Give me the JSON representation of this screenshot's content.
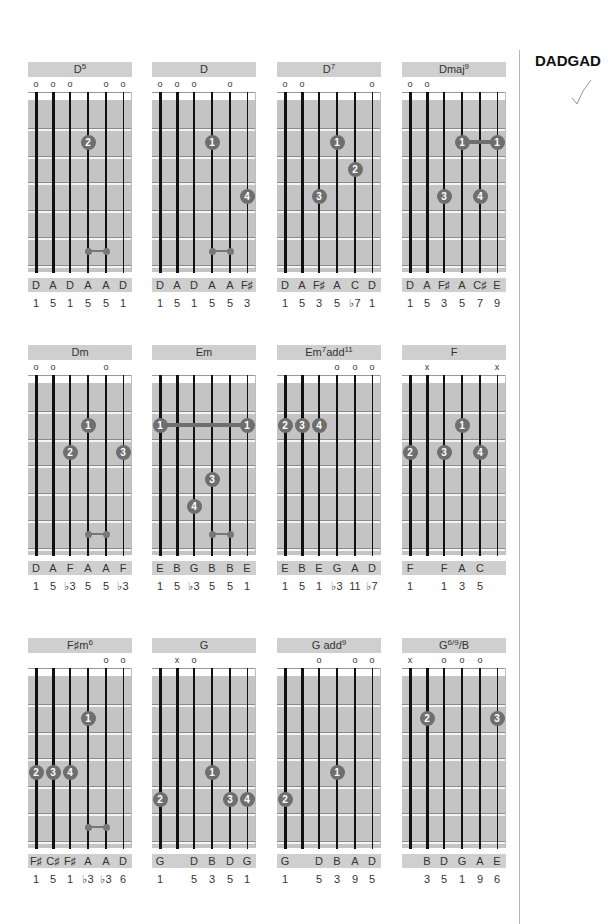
{
  "tuning": {
    "name": "DADGAD",
    "check_icon": "checkmark-icon"
  },
  "layout": {
    "columns": [
      28,
      152,
      277,
      402
    ],
    "rows": [
      62,
      345,
      638
    ],
    "string_offsets": [
      8,
      25,
      42,
      60,
      78,
      95
    ],
    "fret_lines": [
      66,
      94,
      120,
      148,
      175,
      203
    ],
    "slot_centers": [
      52,
      80,
      107,
      134,
      161,
      189
    ]
  },
  "colors": {
    "bar": "#cfcfcf",
    "board": "#c4c4c4",
    "finger": "#6e6e6e"
  },
  "chords": [
    {
      "name": "D",
      "sup": "5",
      "suffix": "",
      "col": 0,
      "row": 0,
      "markers": [
        "o",
        "o",
        "o",
        "",
        "o",
        "o"
      ],
      "fingers": [
        {
          "s": 3,
          "slot": 2,
          "label": "2"
        }
      ],
      "barres": [],
      "minis": [
        {
          "from": 3,
          "to": 4,
          "slot": 6
        }
      ],
      "notes": [
        "D",
        "A",
        "D",
        "A",
        "A",
        "D"
      ],
      "intervals": [
        "1",
        "5",
        "1",
        "5",
        "5",
        "1"
      ]
    },
    {
      "name": "D",
      "sup": "",
      "suffix": "",
      "col": 1,
      "row": 0,
      "markers": [
        "o",
        "o",
        "o",
        "",
        "o",
        ""
      ],
      "fingers": [
        {
          "s": 3,
          "slot": 2,
          "label": "1"
        },
        {
          "s": 5,
          "slot": 4,
          "label": "4"
        }
      ],
      "barres": [],
      "minis": [
        {
          "from": 3,
          "to": 4,
          "slot": 6
        }
      ],
      "notes": [
        "D",
        "A",
        "D",
        "A",
        "A",
        "F♯"
      ],
      "intervals": [
        "1",
        "5",
        "1",
        "5",
        "5",
        "3"
      ]
    },
    {
      "name": "D",
      "sup": "7",
      "suffix": "",
      "col": 2,
      "row": 0,
      "markers": [
        "o",
        "o",
        "",
        "",
        "",
        "o"
      ],
      "fingers": [
        {
          "s": 3,
          "slot": 2,
          "label": "1"
        },
        {
          "s": 4,
          "slot": 3,
          "label": "2"
        },
        {
          "s": 2,
          "slot": 4,
          "label": "3"
        }
      ],
      "barres": [],
      "minis": [],
      "notes": [
        "D",
        "A",
        "F♯",
        "A",
        "C",
        "D"
      ],
      "intervals": [
        "1",
        "5",
        "3",
        "5",
        "♭7",
        "1"
      ]
    },
    {
      "name": "Dmaj",
      "sup": "9",
      "suffix": "",
      "col": 3,
      "row": 0,
      "markers": [
        "o",
        "o",
        "",
        "",
        "",
        ""
      ],
      "fingers": [
        {
          "s": 3,
          "slot": 2,
          "label": "1"
        },
        {
          "s": 5,
          "slot": 2,
          "label": "1"
        },
        {
          "s": 2,
          "slot": 4,
          "label": "3"
        },
        {
          "s": 4,
          "slot": 4,
          "label": "4"
        }
      ],
      "barres": [
        {
          "from": 3,
          "to": 5,
          "slot": 2
        }
      ],
      "minis": [],
      "notes": [
        "D",
        "A",
        "F♯",
        "A",
        "C♯",
        "E"
      ],
      "intervals": [
        "1",
        "5",
        "3",
        "5",
        "7",
        "9"
      ]
    },
    {
      "name": "Dm",
      "sup": "",
      "suffix": "",
      "col": 0,
      "row": 1,
      "markers": [
        "o",
        "o",
        "",
        "",
        "o",
        ""
      ],
      "fingers": [
        {
          "s": 3,
          "slot": 2,
          "label": "1"
        },
        {
          "s": 2,
          "slot": 3,
          "label": "2"
        },
        {
          "s": 5,
          "slot": 3,
          "label": "3"
        }
      ],
      "barres": [],
      "minis": [
        {
          "from": 3,
          "to": 4,
          "slot": 6
        }
      ],
      "notes": [
        "D",
        "A",
        "F",
        "A",
        "A",
        "F"
      ],
      "intervals": [
        "1",
        "5",
        "♭3",
        "5",
        "5",
        "♭3"
      ]
    },
    {
      "name": "Em",
      "sup": "",
      "suffix": "",
      "col": 1,
      "row": 1,
      "markers": [
        "",
        "",
        "",
        "",
        "",
        ""
      ],
      "fingers": [
        {
          "s": 0,
          "slot": 2,
          "label": "1"
        },
        {
          "s": 5,
          "slot": 2,
          "label": "1"
        },
        {
          "s": 3,
          "slot": 4,
          "label": "3"
        },
        {
          "s": 2,
          "slot": 5,
          "label": "4"
        }
      ],
      "barres": [
        {
          "from": 0,
          "to": 5,
          "slot": 2
        }
      ],
      "minis": [
        {
          "from": 3,
          "to": 4,
          "slot": 6
        }
      ],
      "notes": [
        "E",
        "B",
        "G",
        "B",
        "B",
        "E"
      ],
      "intervals": [
        "1",
        "5",
        "♭3",
        "5",
        "5",
        "1"
      ]
    },
    {
      "name": "Em",
      "sup": "7",
      "suffix": "add",
      "sup2": "11",
      "col": 2,
      "row": 1,
      "markers": [
        "",
        "",
        "",
        "o",
        "o",
        "o"
      ],
      "fingers": [
        {
          "s": 0,
          "slot": 2,
          "label": "2"
        },
        {
          "s": 1,
          "slot": 2,
          "label": "3"
        },
        {
          "s": 2,
          "slot": 2,
          "label": "4"
        }
      ],
      "barres": [],
      "minis": [],
      "notes": [
        "E",
        "B",
        "E",
        "G",
        "A",
        "D"
      ],
      "intervals": [
        "1",
        "5",
        "1",
        "♭3",
        "11",
        "♭7"
      ]
    },
    {
      "name": "F",
      "sup": "",
      "suffix": "",
      "col": 3,
      "row": 1,
      "markers": [
        "",
        "x",
        "",
        "",
        "",
        "x"
      ],
      "fingers": [
        {
          "s": 3,
          "slot": 2,
          "label": "1"
        },
        {
          "s": 0,
          "slot": 3,
          "label": "2"
        },
        {
          "s": 2,
          "slot": 3,
          "label": "3"
        },
        {
          "s": 4,
          "slot": 3,
          "label": "4"
        }
      ],
      "barres": [],
      "minis": [],
      "notes": [
        "F",
        "",
        "F",
        "A",
        "C",
        ""
      ],
      "intervals": [
        "1",
        "",
        "1",
        "3",
        "5",
        ""
      ]
    },
    {
      "name": "F♯m",
      "sup": "6",
      "suffix": "",
      "col": 0,
      "row": 2,
      "markers": [
        "",
        "",
        "",
        "",
        "o",
        "o"
      ],
      "fingers": [
        {
          "s": 3,
          "slot": 2,
          "label": "1"
        },
        {
          "s": 0,
          "slot": 4,
          "label": "2"
        },
        {
          "s": 1,
          "slot": 4,
          "label": "3"
        },
        {
          "s": 2,
          "slot": 4,
          "label": "4"
        }
      ],
      "barres": [],
      "minis": [
        {
          "from": 3,
          "to": 4,
          "slot": 6
        }
      ],
      "notes": [
        "F♯",
        "C♯",
        "F♯",
        "A",
        "A",
        "D"
      ],
      "intervals": [
        "1",
        "5",
        "1",
        "♭3",
        "♭3",
        "6"
      ]
    },
    {
      "name": "G",
      "sup": "",
      "suffix": "",
      "col": 1,
      "row": 2,
      "markers": [
        "",
        "x",
        "o",
        "",
        "",
        ""
      ],
      "fingers": [
        {
          "s": 3,
          "slot": 4,
          "label": "1"
        },
        {
          "s": 0,
          "slot": 5,
          "label": "2"
        },
        {
          "s": 4,
          "slot": 5,
          "label": "3"
        },
        {
          "s": 5,
          "slot": 5,
          "label": "4"
        }
      ],
      "barres": [],
      "minis": [],
      "notes": [
        "G",
        "",
        "D",
        "B",
        "D",
        "G"
      ],
      "intervals": [
        "1",
        "",
        "5",
        "3",
        "5",
        "1"
      ]
    },
    {
      "name": "G add",
      "sup": "9",
      "suffix": "",
      "col": 2,
      "row": 2,
      "markers": [
        "",
        "",
        "o",
        "",
        "o",
        "o"
      ],
      "fingers": [
        {
          "s": 3,
          "slot": 4,
          "label": "1"
        },
        {
          "s": 0,
          "slot": 5,
          "label": "2"
        }
      ],
      "barres": [],
      "minis": [],
      "notes": [
        "G",
        "",
        "D",
        "B",
        "A",
        "D"
      ],
      "intervals": [
        "1",
        "",
        "5",
        "3",
        "9",
        "5"
      ]
    },
    {
      "name": "G",
      "sup": "6/9",
      "suffix": "/B",
      "col": 3,
      "row": 2,
      "markers": [
        "x",
        "",
        "o",
        "o",
        "o",
        ""
      ],
      "fingers": [
        {
          "s": 1,
          "slot": 2,
          "label": "2"
        },
        {
          "s": 5,
          "slot": 2,
          "label": "3"
        }
      ],
      "barres": [],
      "minis": [],
      "notes": [
        "",
        "B",
        "D",
        "G",
        "A",
        "E"
      ],
      "intervals": [
        "",
        "3",
        "5",
        "1",
        "9",
        "6"
      ]
    }
  ]
}
